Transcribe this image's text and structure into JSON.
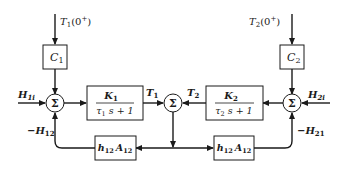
{
  "diagram": {
    "type": "block-diagram",
    "inputs": {
      "t1_initial": {
        "var": "T",
        "sub": "1",
        "arg": "(0",
        "sup": "+",
        "close": ")"
      },
      "t2_initial": {
        "var": "T",
        "sub": "2",
        "arg": "(0",
        "sup": "+",
        "close": ")"
      },
      "h1i": {
        "var": "H",
        "sub": "1i"
      },
      "h2i": {
        "var": "H",
        "sub": "2i"
      }
    },
    "feedback_labels": {
      "minus_h12": {
        "sign": "−",
        "var": "H",
        "sub": "12"
      },
      "minus_h21": {
        "sign": "−",
        "var": "H",
        "sub": "21"
      }
    },
    "blocks": {
      "c1": {
        "var": "C",
        "sub": "1"
      },
      "c2": {
        "var": "C",
        "sub": "2"
      },
      "k1": {
        "num_var": "K",
        "num_sub": "1",
        "den_tau": "τ",
        "den_sub": "1",
        "den_rest": " s + 1"
      },
      "k2": {
        "num_var": "K",
        "num_sub": "2",
        "den_tau": "τ",
        "den_sub": "2",
        "den_rest": " s + 1"
      },
      "h12a12_left": {
        "h": "h",
        "h_sub": "12",
        "a": "A",
        "a_sub": "12"
      },
      "h12a12_right": {
        "h": "h",
        "h_sub": "12",
        "a": "A",
        "a_sub": "12"
      }
    },
    "signals": {
      "t1": {
        "var": "T",
        "sub": "1"
      },
      "t2": {
        "var": "T",
        "sub": "2"
      }
    },
    "summing_junctions": {
      "symbol": "Σ",
      "left": "sum-left",
      "center": "sum-center",
      "right": "sum-right"
    },
    "colors": {
      "line": "#1a1a1a",
      "background": "#ffffff"
    }
  }
}
